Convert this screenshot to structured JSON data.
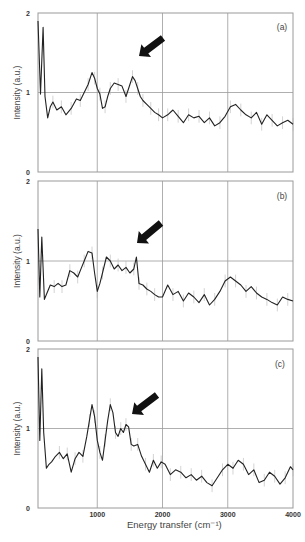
{
  "figure": {
    "xlabel": "Energy transfer (cm⁻¹)",
    "ylabel": "Intensity (a.u.)",
    "x_ticks": [
      "1000",
      "2000",
      "3000",
      "4000"
    ],
    "y_ticks": [
      "0",
      "1",
      "2"
    ],
    "line_color": "#222222",
    "grid_color": "#9a9a9a",
    "arrow_color": "#111111"
  },
  "chart_data": [
    {
      "type": "line",
      "panel": "(a)",
      "title": "",
      "xlabel": "Energy transfer (cm-1)",
      "ylabel": "Intensity (a.u.)",
      "xlim": [
        90,
        4000
      ],
      "ylim": [
        0,
        2
      ],
      "grid": true,
      "annotation": "arrow pointing at peak near 1600 cm-1",
      "x": [
        90,
        130,
        170,
        200,
        240,
        280,
        320,
        380,
        450,
        520,
        600,
        680,
        740,
        800,
        860,
        920,
        960,
        1000,
        1040,
        1080,
        1120,
        1160,
        1200,
        1260,
        1320,
        1380,
        1440,
        1500,
        1540,
        1580,
        1620,
        1660,
        1700,
        1760,
        1820,
        1880,
        1940,
        2000,
        2080,
        2160,
        2240,
        2320,
        2400,
        2480,
        2560,
        2640,
        2720,
        2800,
        2880,
        2960,
        3040,
        3120,
        3200,
        3280,
        3360,
        3440,
        3520,
        3600,
        3680,
        3760,
        3840,
        3920,
        4000
      ],
      "values": [
        1.9,
        0.98,
        1.82,
        0.95,
        0.68,
        0.82,
        0.88,
        0.78,
        0.82,
        0.72,
        0.8,
        0.92,
        0.9,
        1.0,
        1.1,
        1.25,
        1.18,
        1.05,
        0.98,
        0.8,
        0.82,
        0.95,
        1.05,
        1.12,
        1.1,
        1.08,
        0.95,
        1.1,
        1.2,
        1.15,
        1.05,
        0.95,
        0.9,
        0.85,
        0.8,
        0.75,
        0.72,
        0.68,
        0.72,
        0.78,
        0.7,
        0.62,
        0.72,
        0.68,
        0.7,
        0.62,
        0.68,
        0.58,
        0.62,
        0.7,
        0.82,
        0.85,
        0.78,
        0.72,
        0.68,
        0.75,
        0.6,
        0.72,
        0.65,
        0.58,
        0.62,
        0.65,
        0.6
      ]
    },
    {
      "type": "line",
      "panel": "(b)",
      "title": "",
      "xlabel": "Energy transfer (cm-1)",
      "ylabel": "Intensity (a.u.)",
      "xlim": [
        90,
        4000
      ],
      "ylim": [
        0,
        2
      ],
      "grid": true,
      "annotation": "arrow pointing at peak near 1600 cm-1",
      "x": [
        90,
        120,
        150,
        190,
        230,
        280,
        340,
        400,
        460,
        520,
        580,
        640,
        700,
        760,
        800,
        860,
        920,
        960,
        1000,
        1040,
        1080,
        1140,
        1200,
        1260,
        1320,
        1380,
        1440,
        1500,
        1560,
        1600,
        1640,
        1700,
        1760,
        1820,
        1880,
        1940,
        2000,
        2080,
        2160,
        2240,
        2320,
        2400,
        2480,
        2560,
        2640,
        2720,
        2800,
        2880,
        2960,
        3040,
        3120,
        3200,
        3280,
        3360,
        3440,
        3520,
        3600,
        3680,
        3760,
        3840,
        3920,
        4000
      ],
      "values": [
        1.4,
        0.55,
        1.3,
        0.52,
        0.6,
        0.7,
        0.68,
        0.72,
        0.68,
        0.7,
        0.88,
        0.85,
        0.8,
        0.92,
        1.0,
        1.12,
        1.1,
        0.85,
        0.62,
        0.72,
        0.85,
        1.05,
        1.0,
        0.9,
        0.95,
        0.88,
        0.92,
        0.85,
        0.9,
        1.05,
        0.72,
        0.7,
        0.65,
        0.62,
        0.58,
        0.55,
        0.55,
        0.7,
        0.58,
        0.62,
        0.5,
        0.6,
        0.55,
        0.48,
        0.58,
        0.45,
        0.52,
        0.62,
        0.75,
        0.8,
        0.75,
        0.7,
        0.62,
        0.68,
        0.6,
        0.55,
        0.52,
        0.48,
        0.45,
        0.55,
        0.52,
        0.5
      ]
    },
    {
      "type": "line",
      "panel": "(c)",
      "title": "",
      "xlabel": "Energy transfer (cm-1)",
      "ylabel": "Intensity (a.u.)",
      "xlim": [
        90,
        4000
      ],
      "ylim": [
        0,
        2
      ],
      "grid": true,
      "annotation": "arrow pointing at peak near 1500 cm-1",
      "x": [
        90,
        120,
        150,
        180,
        220,
        260,
        300,
        360,
        420,
        480,
        540,
        600,
        660,
        720,
        780,
        840,
        880,
        920,
        960,
        1000,
        1040,
        1080,
        1120,
        1160,
        1200,
        1240,
        1280,
        1320,
        1360,
        1400,
        1440,
        1480,
        1520,
        1560,
        1620,
        1680,
        1740,
        1800,
        1860,
        1920,
        1980,
        2040,
        2120,
        2200,
        2280,
        2360,
        2440,
        2520,
        2600,
        2680,
        2760,
        2840,
        2920,
        3000,
        3080,
        3160,
        3240,
        3320,
        3400,
        3480,
        3560,
        3640,
        3720,
        3800,
        3880,
        3960,
        4000
      ],
      "values": [
        1.9,
        0.85,
        1.75,
        0.95,
        0.5,
        0.55,
        0.58,
        0.65,
        0.7,
        0.62,
        0.68,
        0.45,
        0.62,
        0.7,
        0.65,
        0.9,
        1.1,
        1.3,
        1.15,
        0.85,
        0.7,
        0.6,
        0.85,
        1.1,
        1.3,
        1.2,
        0.95,
        0.9,
        1.0,
        0.95,
        1.05,
        1.02,
        0.8,
        0.78,
        0.8,
        0.65,
        0.55,
        0.45,
        0.6,
        0.5,
        0.58,
        0.55,
        0.42,
        0.48,
        0.45,
        0.38,
        0.42,
        0.35,
        0.4,
        0.32,
        0.28,
        0.38,
        0.48,
        0.55,
        0.5,
        0.6,
        0.55,
        0.42,
        0.48,
        0.32,
        0.35,
        0.45,
        0.4,
        0.3,
        0.38,
        0.52,
        0.48
      ]
    }
  ]
}
